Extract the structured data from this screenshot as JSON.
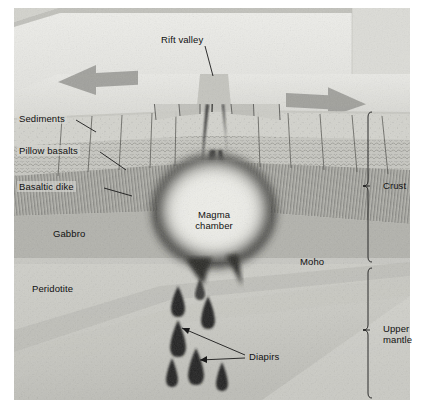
{
  "figure": {
    "type": "geologic-block-diagram",
    "width": 431,
    "height": 418
  },
  "labels": {
    "rift_valley": "Rift valley",
    "sediments": "Sediments",
    "pillow_basalts": "Pillow basalts",
    "basaltic_dike": "Basaltic dike",
    "gabbro": "Gabbro",
    "magma_chamber_line1": "Magma",
    "magma_chamber_line2": "chamber",
    "peridotite": "Peridotite",
    "moho": "Moho",
    "diapirs": "Diapirs",
    "crust": "Crust",
    "upper_mantle_line1": "Upper",
    "upper_mantle_line2": "mantle"
  },
  "brackets": [
    {
      "name": "crust",
      "label": "Crust",
      "top": 112,
      "bottom": 262
    },
    {
      "name": "upper-mantle",
      "label": "Upper mantle",
      "top": 266,
      "bottom": 398
    }
  ],
  "arrows": [
    {
      "name": "spreading-arrow-left",
      "direction": "left"
    },
    {
      "name": "spreading-arrow-right",
      "direction": "right"
    }
  ],
  "layers": [
    {
      "name": "sediments",
      "label": "Sediments",
      "texture": "stipple"
    },
    {
      "name": "pillow-basalts",
      "label": "Pillow basalts",
      "texture": "wavy-pillows"
    },
    {
      "name": "basaltic-dike",
      "label": "Basaltic dike",
      "texture": "vertical-hatch"
    },
    {
      "name": "gabbro",
      "label": "Gabbro",
      "texture": "smooth-mid-gray"
    },
    {
      "name": "peridotite",
      "label": "Peridotite",
      "texture": "smooth-light-gray"
    }
  ],
  "diapir_count": 7,
  "colors": {
    "page_background": "#ffffff",
    "block_top": "#d8d8d4",
    "block_face_upper": "#e6e6e2",
    "sediment": "#cfcfc9",
    "pillow": "#c6c6c0",
    "dike": "#bfbfb9",
    "gabbro": "#b4b4ae",
    "mantle_light": "#d2d2cc",
    "mantle_mid": "#c0c0ba",
    "magma_rim": "#2a2a28",
    "magma_core": "#eeeee9",
    "ink": "#111111",
    "arrow_fill": "#9a9a96"
  }
}
